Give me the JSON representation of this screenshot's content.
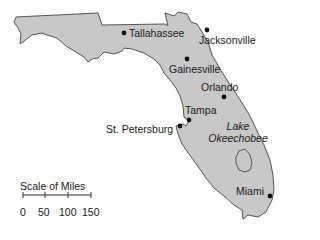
{
  "map": {
    "region": "Florida",
    "land_color": "#c8c8c8",
    "outline_color": "#555555",
    "cities": [
      {
        "name": "Tallahassee",
        "x": 124,
        "y": 33
      },
      {
        "name": "Jacksonville",
        "x": 207,
        "y": 30
      },
      {
        "name": "Gainesville",
        "x": 187,
        "y": 59
      },
      {
        "name": "Orlando",
        "x": 224,
        "y": 97
      },
      {
        "name": "Tampa",
        "x": 189,
        "y": 120
      },
      {
        "name": "St. Petersburg",
        "x": 180,
        "y": 125
      },
      {
        "name": "Miami",
        "x": 270,
        "y": 196
      }
    ],
    "lake": {
      "name_line1": "Lake",
      "name_line2": "Okeechobee"
    }
  },
  "scale": {
    "title": "Scale of Miles",
    "ticks": [
      "0",
      "50",
      "100",
      "150"
    ],
    "unit": "miles"
  }
}
